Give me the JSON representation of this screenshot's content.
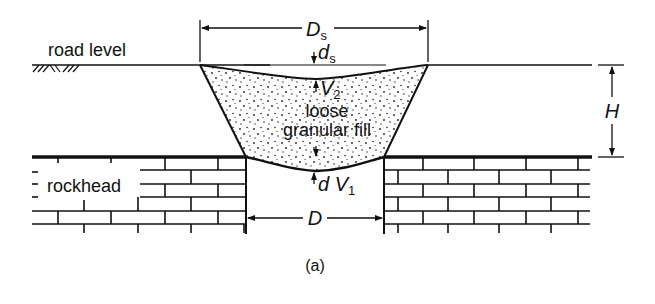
{
  "figure": {
    "caption": "(a)",
    "labels": {
      "road_level": "road level",
      "rockhead": "rockhead",
      "fill_line1": "loose",
      "fill_line2": "granular fill",
      "Ds_main": "D",
      "Ds_sub": "s",
      "ds_main": "d",
      "ds_sub": "s",
      "V2_main": "V",
      "V2_sub": "2",
      "dV1_prefix": "d V",
      "dV1_sub": "1",
      "H": "H",
      "D": "D"
    }
  },
  "colors": {
    "ink": "#111111",
    "background": "#ffffff"
  }
}
